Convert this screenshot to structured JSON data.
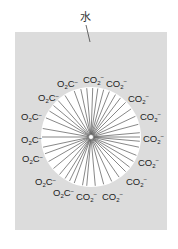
{
  "diagram": {
    "title_label": "水",
    "colors": {
      "background": "#ffffff",
      "panel": "#dcdcdc",
      "micelle_core": "#ffffff",
      "chain_line": "#555555",
      "text": "#222222"
    },
    "panel": {
      "x": 15,
      "y": 32,
      "width": 152,
      "height": 198
    },
    "micelle": {
      "cx": 91,
      "cy": 137,
      "r": 50,
      "hub_r": 2.5
    },
    "leader": {
      "x1": 86,
      "y1": 25,
      "x2": 90,
      "y2": 42,
      "label_x": 80,
      "label_y": 21
    },
    "headgroups": [
      {
        "text": "O2C-",
        "form": "O2C",
        "x": 57,
        "y": 87,
        "angle": 250
      },
      {
        "text": "CO2-",
        "form": "CO2",
        "x": 83,
        "y": 83,
        "angle": 272
      },
      {
        "text": "CO2-",
        "form": "CO2",
        "x": 106,
        "y": 87,
        "angle": 292
      },
      {
        "text": "CO2-",
        "form": "CO2",
        "x": 128,
        "y": 102,
        "angle": 315
      },
      {
        "text": "CO2-",
        "form": "CO2",
        "x": 140,
        "y": 120,
        "angle": 335
      },
      {
        "text": "CO2-",
        "form": "CO2",
        "x": 143,
        "y": 142,
        "angle": 0
      },
      {
        "text": "CO2-",
        "form": "CO2",
        "x": 138,
        "y": 166,
        "angle": 22
      },
      {
        "text": "CO2-",
        "form": "CO2",
        "x": 126,
        "y": 185,
        "angle": 45
      },
      {
        "text": "CO2-",
        "form": "CO2",
        "x": 102,
        "y": 200,
        "angle": 75
      },
      {
        "text": "CO2-",
        "form": "CO2",
        "x": 76,
        "y": 200,
        "angle": 100
      },
      {
        "text": "O2C-",
        "form": "O2C",
        "x": 53,
        "y": 196,
        "angle": 122
      },
      {
        "text": "O2C-",
        "form": "O2C",
        "x": 35,
        "y": 185,
        "angle": 140
      },
      {
        "text": "O2C-",
        "form": "O2C",
        "x": 22,
        "y": 162,
        "angle": 160
      },
      {
        "text": "O2C-",
        "form": "O2C",
        "x": 21,
        "y": 143,
        "angle": 180
      },
      {
        "text": "O2C-",
        "form": "O2C",
        "x": 21,
        "y": 120,
        "angle": 203
      },
      {
        "text": "O2C-",
        "form": "O2C",
        "x": 38,
        "y": 101,
        "angle": 228
      }
    ],
    "chains": [
      250,
      258,
      265,
      272,
      278,
      285,
      292,
      300,
      307,
      315,
      325,
      335,
      345,
      355,
      0,
      5,
      12,
      22,
      30,
      38,
      45,
      55,
      65,
      75,
      85,
      95,
      100,
      110,
      116,
      122,
      130,
      140,
      150,
      160,
      168,
      180,
      190,
      203,
      212,
      220,
      228,
      238
    ]
  }
}
